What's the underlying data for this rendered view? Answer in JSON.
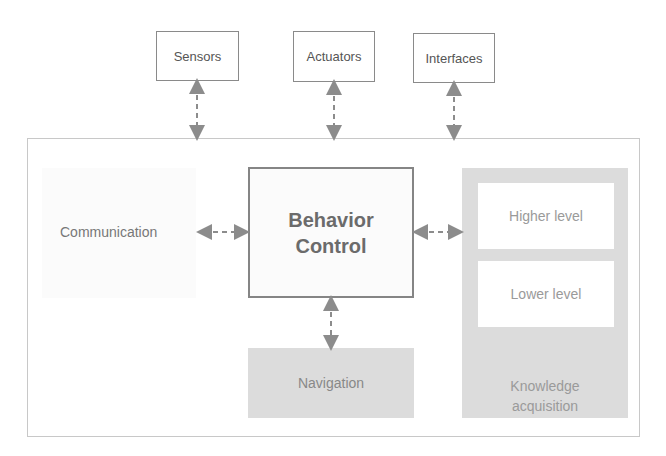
{
  "diagram": {
    "external": [
      {
        "label": "Sensors"
      },
      {
        "label": "Actuators"
      },
      {
        "label": "Interfaces"
      }
    ],
    "communication": {
      "label": "Communication"
    },
    "behavior_control": {
      "line1": "Behavior",
      "line2": "Control"
    },
    "navigation": {
      "label": "Navigation"
    },
    "knowledge": {
      "higher": "Higher level",
      "lower": "Lower level",
      "title_line1": "Knowledge",
      "title_line2": "acquisition"
    },
    "colors": {
      "arrow": "#8c8c8c",
      "box_border": "#858585",
      "panel_fill": "#dcdcdc",
      "frame_border": "#c8c8c8"
    }
  }
}
